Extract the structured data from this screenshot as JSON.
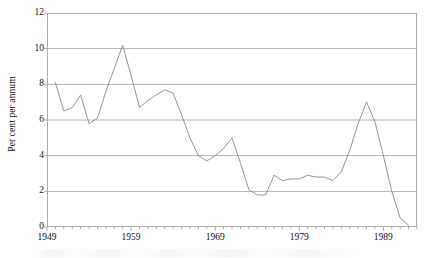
{
  "chart_data": {
    "type": "line",
    "title": "",
    "xlabel": "",
    "ylabel": "Per cent per annum",
    "xlim": [
      1949,
      1993
    ],
    "ylim": [
      0,
      12
    ],
    "grid": true,
    "grid_axis": "y",
    "legend": false,
    "legend_position": "none",
    "y_ticks": [
      0,
      2,
      4,
      6,
      8,
      10,
      12
    ],
    "y_tick_labels": [
      "0",
      "2",
      "4",
      "6",
      "8",
      "10",
      "12"
    ],
    "x_ticks": [
      1949,
      1959,
      1969,
      1979,
      1989
    ],
    "x_tick_labels": [
      "1949",
      "1959",
      "1969",
      "1979",
      "1989"
    ],
    "x_minor_tick_interval": 1,
    "series": [
      {
        "name": "Per cent per annum",
        "color": "#8a8a8a",
        "x": [
          1950,
          1951,
          1952,
          1953,
          1954,
          1955,
          1956,
          1957,
          1958,
          1959,
          1960,
          1961,
          1962,
          1963,
          1964,
          1965,
          1966,
          1967,
          1968,
          1969,
          1970,
          1971,
          1972,
          1973,
          1974,
          1975,
          1976,
          1977,
          1978,
          1979,
          1980,
          1981,
          1982,
          1983,
          1984,
          1985,
          1986,
          1987,
          1988,
          1989,
          1990,
          1991,
          1992
        ],
        "values": [
          8.1,
          6.5,
          6.7,
          7.4,
          5.8,
          6.1,
          7.6,
          8.9,
          10.2,
          8.5,
          6.7,
          7.1,
          7.4,
          7.7,
          7.5,
          6.3,
          5.0,
          4.0,
          3.7,
          4.0,
          4.4,
          5.0,
          3.6,
          2.1,
          1.8,
          1.8,
          2.9,
          2.6,
          2.7,
          2.7,
          2.9,
          2.8,
          2.8,
          2.6,
          3.1,
          4.3,
          5.8,
          7.0,
          5.9,
          4.0,
          2.0,
          0.5,
          0.1
        ]
      }
    ],
    "annotations": []
  },
  "axes": {
    "y_axis_title": "Per cent per annum",
    "frame": {
      "left_px": 47,
      "top_px": 13,
      "right_px": 417,
      "bottom_px": 227
    }
  }
}
